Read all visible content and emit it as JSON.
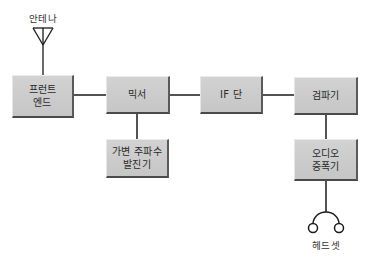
{
  "diagram": {
    "type": "block-diagram",
    "antenna": {
      "label": "안테나",
      "icon": "antenna-icon"
    },
    "headset": {
      "label": "헤드셋",
      "icon": "headset-icon"
    },
    "blocks": [
      {
        "id": "front_end",
        "lines": [
          "프런트",
          "엔드"
        ]
      },
      {
        "id": "mixer",
        "lines": [
          "믹서"
        ]
      },
      {
        "id": "vfo",
        "lines": [
          "가변 주파수",
          "발진기"
        ]
      },
      {
        "id": "if_stage",
        "lines": [
          "IF 단"
        ]
      },
      {
        "id": "detector",
        "lines": [
          "검파기"
        ]
      },
      {
        "id": "audio_amp",
        "lines": [
          "오디오",
          "증폭기"
        ]
      }
    ],
    "connections": [
      [
        "antenna",
        "front_end"
      ],
      [
        "front_end",
        "mixer"
      ],
      [
        "vfo",
        "mixer"
      ],
      [
        "mixer",
        "if_stage"
      ],
      [
        "if_stage",
        "detector"
      ],
      [
        "detector",
        "audio_amp"
      ],
      [
        "audio_amp",
        "headset"
      ]
    ],
    "colors": {
      "block_fill": "#c8c8c8",
      "block_shadow": "#4a4a4a",
      "wire": "#1a1a1a",
      "text": "#2a2a2a"
    }
  }
}
